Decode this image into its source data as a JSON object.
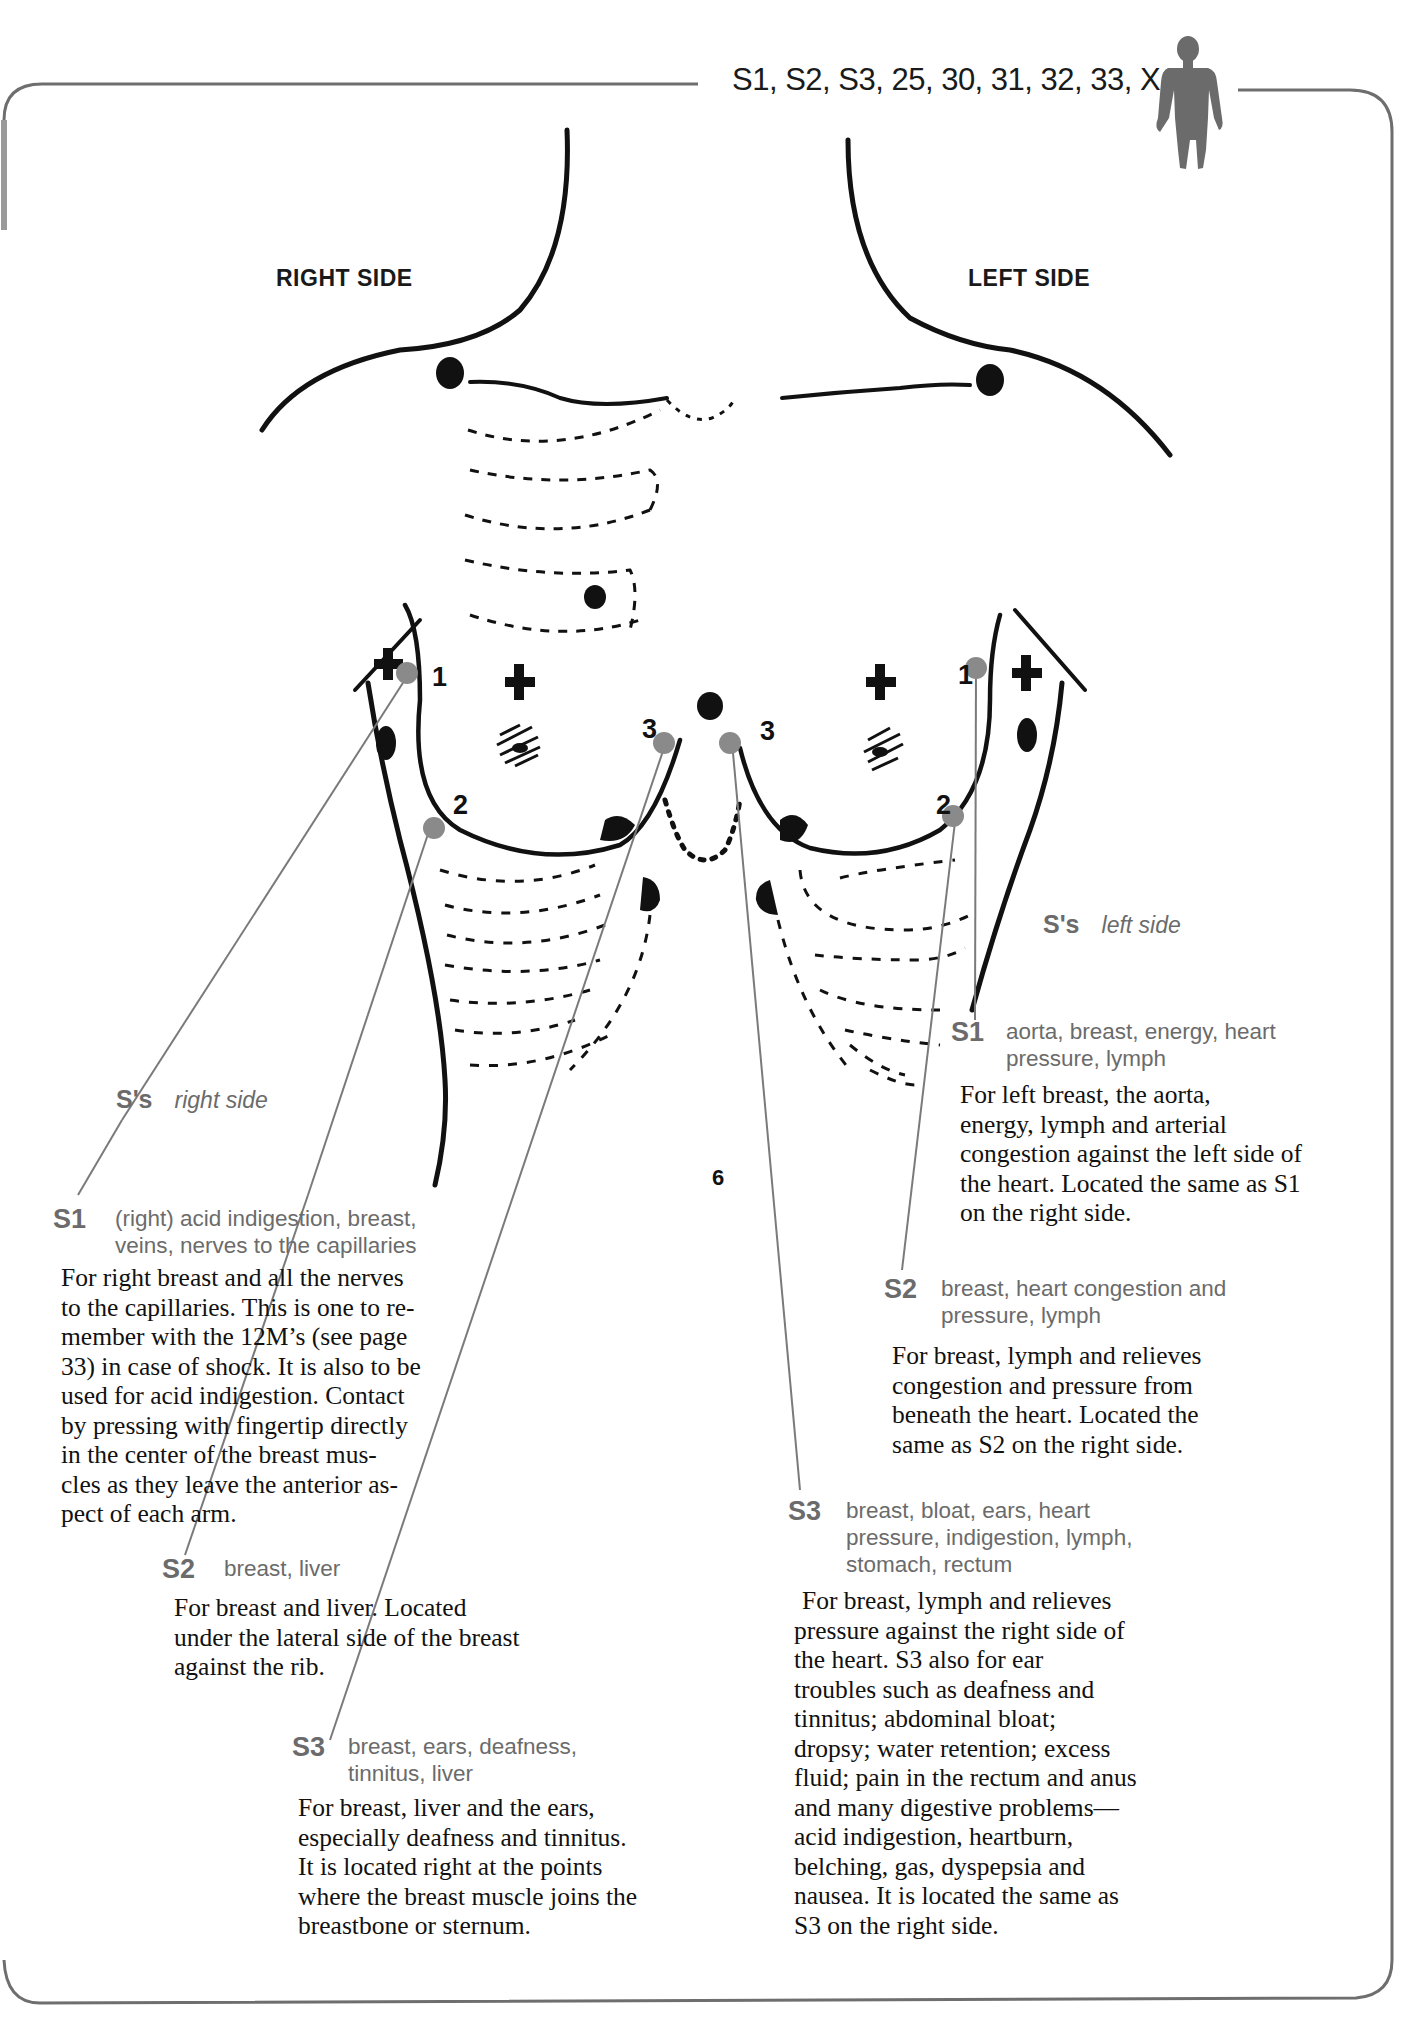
{
  "header": {
    "points": "S1, S2, S3, 25, 30, 31, 32, 33, X",
    "figure_icon": "human-figure-icon"
  },
  "diagram": {
    "right_side_label": "RIGHT SIDE",
    "left_side_label": "LEFT SIDE",
    "point_numbers": {
      "right_1": "1",
      "right_2": "2",
      "right_3": "3",
      "left_1": "1",
      "left_2": "2",
      "left_3": "3"
    },
    "center_mark": "6",
    "colors": {
      "ink": "#111111",
      "marker": "#8a8a8a",
      "leader_line": "#7a7a7a",
      "frame": "#6e6e6e",
      "label_gray": "#6b6b6b"
    }
  },
  "right_side": {
    "group_code": "S's",
    "group_desc": "right side",
    "points": [
      {
        "code": "S1",
        "keywords": "(right) acid indigestion, breast, veins, nerves to the capillaries",
        "keywords_lines": [
          "(right) acid indigestion, breast,",
          "veins, nerves to the capillaries"
        ],
        "body_lines": [
          "For right breast and all the nerves",
          "to the capillaries. This is one to re-",
          "member with the 12M’s (see page",
          "33) in case of shock. It is also to be",
          "used for acid indigestion. Contact",
          "by pressing with fingertip directly",
          "in the center of the breast mus-",
          "cles as they leave the anterior as-",
          "pect of each arm."
        ]
      },
      {
        "code": "S2",
        "keywords": "breast, liver",
        "keywords_lines": [
          "breast, liver"
        ],
        "body_lines": [
          "For breast and liver. Located",
          "under the lateral side of the breast",
          "against the rib."
        ]
      },
      {
        "code": "S3",
        "keywords": "breast, ears, deafness, tinnitus, liver",
        "keywords_lines": [
          "breast, ears, deafness,",
          "tinnitus, liver"
        ],
        "body_lines": [
          "For breast, liver and the ears,",
          "especially deafness and tinnitus.",
          "It is located right at the points",
          "where the breast muscle joins the",
          "breastbone or sternum."
        ]
      }
    ]
  },
  "left_side": {
    "group_code": "S's",
    "group_desc": "left side",
    "points": [
      {
        "code": "S1",
        "keywords": "aorta, breast, energy, heart pressure, lymph",
        "keywords_lines": [
          "aorta, breast, energy, heart",
          "pressure, lymph"
        ],
        "body_lines": [
          "For left breast, the aorta,",
          "energy, lymph and arterial",
          "congestion against the left side of",
          "the heart. Located the same as S1",
          "on the right side."
        ]
      },
      {
        "code": "S2",
        "keywords": "breast, heart congestion and pressure, lymph",
        "keywords_lines": [
          "breast, heart congestion and",
          "pressure, lymph"
        ],
        "body_lines": [
          "For breast, lymph and relieves",
          "congestion and pressure from",
          "beneath the heart. Located the",
          "same as S2 on the right side."
        ]
      },
      {
        "code": "S3",
        "keywords": "breast, bloat, ears, heart pressure, indigestion, lymph, stomach, rectum",
        "keywords_lines": [
          "breast, bloat, ears, heart",
          "pressure, indigestion, lymph,",
          "stomach, rectum"
        ],
        "body_lines": [
          "For breast, lymph and relieves",
          "pressure against the right side of",
          "the heart. S3 also for ear",
          "troubles such as deafness and",
          "tinnitus; abdominal bloat;",
          "dropsy; water retention; excess",
          "fluid; pain in the rectum and anus",
          "and many digestive problems—",
          "acid indigestion, heartburn,",
          "belching, gas, dyspepsia and",
          "nausea. It is located the same as",
          "S3 on the right side."
        ]
      }
    ]
  }
}
